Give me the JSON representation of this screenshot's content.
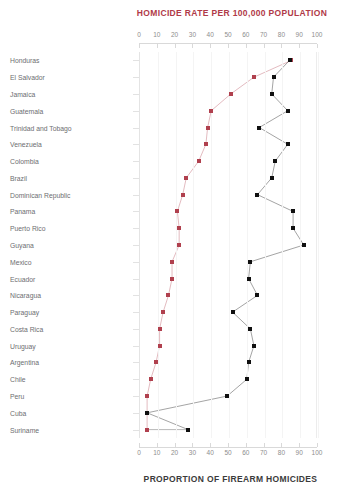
{
  "chart_data": {
    "type": "scatter",
    "title": "HOMICIDE RATE PER 100,000 POPULATION",
    "subtitle": "PROPORTION OF FIREARM HOMICIDES",
    "top_axis_label": "HOMICIDE RATE PER 100,000 POPULATION",
    "bottom_axis_label": "PROPORTION OF FIREARM HOMICIDES",
    "xlabel": "",
    "ylabel": "",
    "xlim": [
      0,
      100
    ],
    "ticks": [
      0,
      10,
      20,
      30,
      40,
      50,
      60,
      70,
      80,
      90,
      100
    ],
    "tick_labels": [
      "0",
      "10",
      "20",
      "30",
      "40",
      "50",
      "60",
      "70",
      "80",
      "90",
      "100"
    ],
    "grid": true,
    "legend_position": "none",
    "orientation": "horizontal-dotplot",
    "categories": [
      "Honduras",
      "El Salvador",
      "Jamaica",
      "Guatemala",
      "Trinidad and Tobago",
      "Venezuela",
      "Colombia",
      "Brazil",
      "Dominican Republic",
      "Panama",
      "Puerto Rico",
      "Guyana",
      "Mexico",
      "Ecuador",
      "Nicaragua",
      "Paraguay",
      "Costa Rica",
      "Uruguay",
      "Argentina",
      "Chile",
      "Peru",
      "Cuba",
      "Suriname"
    ],
    "series": [
      {
        "name": "Homicide rate per 100,000 population",
        "color": "#b0404e",
        "marker": "square",
        "values": [
          85,
          64,
          51,
          40,
          38,
          37,
          33,
          26,
          24,
          21,
          22,
          22,
          18,
          18,
          16,
          13,
          11,
          11,
          9,
          6,
          4,
          4,
          4
        ]
      },
      {
        "name": "Proportion of firearm homicides",
        "color": "#101010",
        "marker": "square",
        "values": [
          84,
          75,
          74,
          83,
          67,
          83,
          76,
          74,
          66,
          86,
          86,
          92,
          62,
          61,
          66,
          52,
          62,
          64,
          61,
          60,
          49,
          4,
          27
        ]
      }
    ]
  }
}
